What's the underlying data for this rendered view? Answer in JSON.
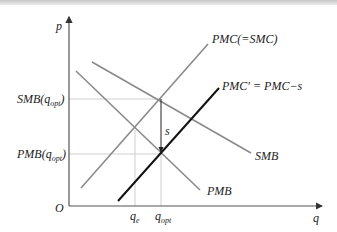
{
  "figure": {
    "axes": {
      "y_label": "p",
      "x_label": "q",
      "origin_label": "O"
    },
    "y_ticks": [
      {
        "name": "smb-qopt",
        "main": "SMB(q",
        "sub": "opt",
        "close": ")"
      },
      {
        "name": "pmb-qopt",
        "main": "PMB(q",
        "sub": "opt",
        "close": ")"
      }
    ],
    "x_ticks": [
      {
        "name": "qe",
        "main": "q",
        "sub": "e"
      },
      {
        "name": "qopt",
        "main": "q",
        "sub": "opt"
      }
    ],
    "curves": {
      "pmc": "PMC(=SMC)",
      "pmc_prime": "PMC′ = PMC−s",
      "smb": "SMB",
      "pmb": "PMB"
    },
    "subsidy_label": "s",
    "colors": {
      "axis": "#555555",
      "curve": "#8a8a8a",
      "subsidy_curve": "#111111",
      "gridline": "#cfcfcf"
    }
  }
}
